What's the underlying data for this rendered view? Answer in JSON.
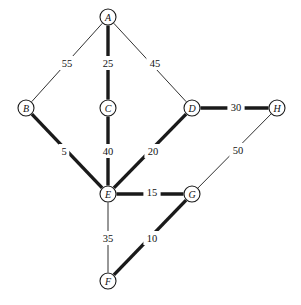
{
  "figure": {
    "type": "undirected-weighted-graph",
    "title": "",
    "background_color": "#ffffff",
    "stroke_color": "#1a1a1a",
    "width": 301,
    "height": 305
  },
  "nodes": [
    {
      "id": "A",
      "label": "A",
      "x": 108,
      "y": 17,
      "r": 8
    },
    {
      "id": "B",
      "label": "B",
      "x": 26,
      "y": 108,
      "r": 8
    },
    {
      "id": "C",
      "label": "C",
      "x": 108,
      "y": 108,
      "r": 8
    },
    {
      "id": "D",
      "label": "D",
      "x": 192,
      "y": 108,
      "r": 8
    },
    {
      "id": "H",
      "label": "H",
      "x": 277,
      "y": 108,
      "r": 8
    },
    {
      "id": "E",
      "label": "E",
      "x": 108,
      "y": 194,
      "r": 8
    },
    {
      "id": "G",
      "label": "G",
      "x": 192,
      "y": 194,
      "r": 8
    },
    {
      "id": "F",
      "label": "F",
      "x": 108,
      "y": 281,
      "r": 8
    }
  ],
  "edges": [
    {
      "from": "A",
      "to": "B",
      "weight": "55",
      "weight_value": 55,
      "style": "thin",
      "label_x": 67,
      "label_y": 63
    },
    {
      "from": "A",
      "to": "C",
      "weight": "25",
      "weight_value": 25,
      "style": "thick",
      "label_x": 108,
      "label_y": 63
    },
    {
      "from": "A",
      "to": "D",
      "weight": "45",
      "weight_value": 45,
      "style": "thin",
      "label_x": 155,
      "label_y": 63
    },
    {
      "from": "B",
      "to": "E",
      "weight": "5",
      "weight_value": 5,
      "style": "thick",
      "label_x": 64,
      "label_y": 151
    },
    {
      "from": "C",
      "to": "E",
      "weight": "40",
      "weight_value": 40,
      "style": "thick",
      "label_x": 108,
      "label_y": 151
    },
    {
      "from": "D",
      "to": "E",
      "weight": "20",
      "weight_value": 20,
      "style": "thick",
      "label_x": 153,
      "label_y": 151
    },
    {
      "from": "D",
      "to": "H",
      "weight": "30",
      "weight_value": 30,
      "style": "thick",
      "label_x": 236,
      "label_y": 107
    },
    {
      "from": "H",
      "to": "G",
      "weight": "50",
      "weight_value": 50,
      "style": "thin",
      "label_x": 238,
      "label_y": 150
    },
    {
      "from": "E",
      "to": "G",
      "weight": "15",
      "weight_value": 15,
      "style": "thick",
      "label_x": 152,
      "label_y": 192
    },
    {
      "from": "E",
      "to": "F",
      "weight": "35",
      "weight_value": 35,
      "style": "thin",
      "label_x": 108,
      "label_y": 238
    },
    {
      "from": "F",
      "to": "G",
      "weight": "10",
      "weight_value": 10,
      "style": "thick",
      "label_x": 152,
      "label_y": 238
    }
  ]
}
